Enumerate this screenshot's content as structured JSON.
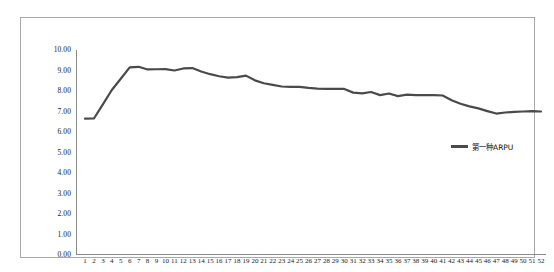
{
  "chart_data": {
    "type": "line",
    "title": "",
    "subtitle": "",
    "xlabel": "",
    "ylabel": "",
    "ylim": [
      0,
      10
    ],
    "ytick_step": 1,
    "ytick_format": "0.00",
    "yticks": [
      "0.00",
      "1.00",
      "2.00",
      "3.00",
      "4.00",
      "5.00",
      "6.00",
      "7.00",
      "8.00",
      "9.00",
      "10.00"
    ],
    "xlim": [
      1,
      52
    ],
    "grid": false,
    "legend_position": "center-right",
    "line_color": "#4a4a4a",
    "line_width": 2.2,
    "categories": [
      1,
      2,
      3,
      4,
      5,
      6,
      7,
      8,
      9,
      10,
      11,
      12,
      13,
      14,
      15,
      16,
      17,
      18,
      19,
      20,
      21,
      22,
      23,
      24,
      25,
      26,
      27,
      28,
      29,
      30,
      31,
      32,
      33,
      34,
      35,
      36,
      37,
      38,
      39,
      40,
      41,
      42,
      43,
      44,
      45,
      46,
      47,
      48,
      49,
      50,
      51,
      52
    ],
    "xticklabels": [
      "1",
      "2",
      "3",
      "4",
      "5",
      "6",
      "7",
      "8",
      "9",
      "10",
      "11",
      "12",
      "13",
      "14",
      "15",
      "16",
      "17",
      "18",
      "19",
      "20",
      "21",
      "22",
      "23",
      "24",
      "25",
      "26",
      "27",
      "28",
      "29",
      "30",
      "31",
      "32",
      "33",
      "34",
      "35",
      "36",
      "37",
      "38",
      "39",
      "40",
      "41",
      "42",
      "43",
      "44",
      "45",
      "46",
      "47",
      "48",
      "49",
      "50",
      "51",
      "52"
    ],
    "series": [
      {
        "name": "第一种ARPU",
        "color": "#4a4a4a",
        "values": [
          6.65,
          6.66,
          7.35,
          8.05,
          8.6,
          9.15,
          9.18,
          9.05,
          9.06,
          9.07,
          9.0,
          9.1,
          9.12,
          8.95,
          8.82,
          8.72,
          8.65,
          8.68,
          8.75,
          8.52,
          8.38,
          8.3,
          8.22,
          8.2,
          8.2,
          8.15,
          8.12,
          8.1,
          8.1,
          8.1,
          7.92,
          7.88,
          7.95,
          7.8,
          7.88,
          7.75,
          7.82,
          7.8,
          7.8,
          7.8,
          7.78,
          7.55,
          7.38,
          7.25,
          7.15,
          7.02,
          6.9,
          6.95,
          6.98,
          7.0,
          7.02,
          7.0
        ]
      }
    ]
  },
  "legend": {
    "entries": [
      {
        "label": "第一种ARPU"
      }
    ]
  }
}
